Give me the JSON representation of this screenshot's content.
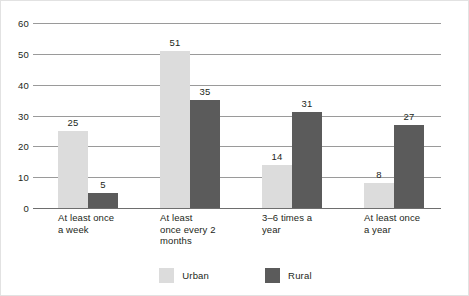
{
  "chart_data": {
    "type": "bar",
    "title": "",
    "subtitle": "",
    "xlabel": "",
    "ylabel": "",
    "ylim": [
      0,
      60
    ],
    "ytick_step": 10,
    "yticks": [
      60,
      50,
      40,
      30,
      20,
      10,
      0
    ],
    "grid": true,
    "legend_position": "bottom-center",
    "categories": [
      "At least once a week",
      "At least once every 2 months",
      "3–6 times a year",
      "At least once a year"
    ],
    "category_lines": [
      [
        "At least once",
        "a week"
      ],
      [
        "At least",
        "once every 2",
        "months"
      ],
      [
        "3–6 times a",
        "year"
      ],
      [
        "At least once",
        "a year"
      ]
    ],
    "series": [
      {
        "name": "Urban",
        "color": "#dcdcdc",
        "values": [
          25,
          51,
          14,
          8
        ]
      },
      {
        "name": "Rural",
        "color": "#5b5b5b",
        "values": [
          5,
          35,
          31,
          27
        ]
      }
    ]
  },
  "legend": {
    "items": [
      {
        "label": "Urban",
        "swatch": "urban-swatch"
      },
      {
        "label": "Rural",
        "swatch": "rural-swatch"
      }
    ]
  },
  "colors": {
    "urban": "#dcdcdc",
    "rural": "#5b5b5b",
    "gridline": "#9a9a9a",
    "axis": "#6e6e6e",
    "text": "#231f20",
    "frame_border": "#e2e2e2",
    "background": "#ffffff"
  }
}
